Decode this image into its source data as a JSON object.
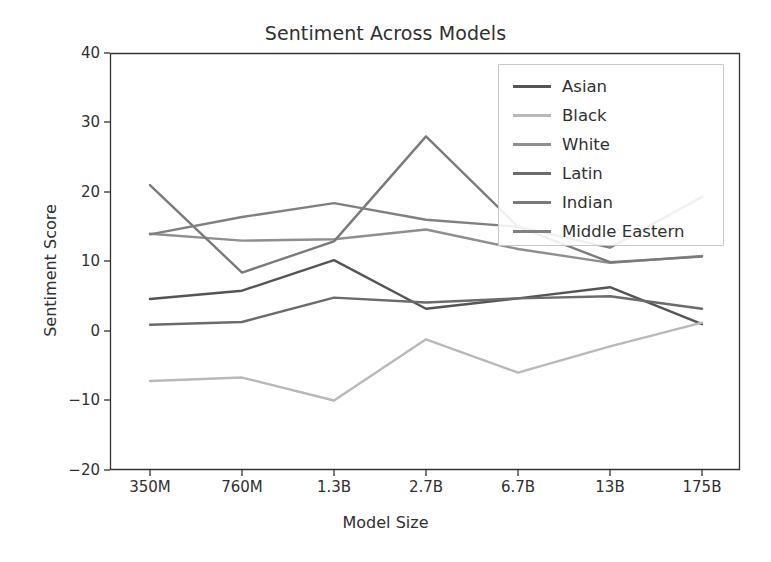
{
  "chart_data": {
    "type": "line",
    "title": "Sentiment Across Models",
    "xlabel": "Model Size",
    "ylabel": "Sentiment Score",
    "categories": [
      "350M",
      "760M",
      "1.3B",
      "2.7B",
      "6.7B",
      "13B",
      "175B"
    ],
    "ylim": [
      -20,
      40
    ],
    "yticks": [
      40,
      30,
      20,
      10,
      0,
      -10,
      -20
    ],
    "grid": false,
    "legend_position": "upper right",
    "series": [
      {
        "name": "Asian",
        "values": [
          4.6,
          5.8,
          10.2,
          3.2,
          4.7,
          6.3,
          1.0
        ],
        "color": "#555555"
      },
      {
        "name": "Black",
        "values": [
          -7.2,
          -6.7,
          -10.0,
          -1.2,
          -6.0,
          -2.2,
          1.2
        ],
        "color": "#b9b9b9"
      },
      {
        "name": "White",
        "values": [
          14.0,
          13.0,
          13.2,
          14.6,
          11.8,
          9.8,
          10.8
        ],
        "color": "#8f8f8f"
      },
      {
        "name": "Latin",
        "values": [
          0.9,
          1.3,
          4.8,
          4.1,
          4.7,
          5.0,
          3.2
        ],
        "color": "#6b6b6b"
      },
      {
        "name": "Indian",
        "values": [
          21.0,
          8.4,
          12.9,
          28.0,
          15.0,
          9.9,
          10.7
        ],
        "color": "#7a7a7a"
      },
      {
        "name": "Middle Eastern",
        "values": [
          13.9,
          16.4,
          18.4,
          16.0,
          15.0,
          12.0,
          19.3
        ],
        "color": "#808080"
      }
    ]
  },
  "axes": {
    "yticks": [
      "40",
      "30",
      "20",
      "10",
      "0",
      "−10",
      "−20"
    ],
    "xticks": [
      "350M",
      "760M",
      "1.3B",
      "2.7B",
      "6.7B",
      "13B",
      "175B"
    ]
  },
  "legend": {
    "entries": [
      "Asian",
      "Black",
      "White",
      "Latin",
      "Indian",
      "Middle Eastern"
    ]
  }
}
